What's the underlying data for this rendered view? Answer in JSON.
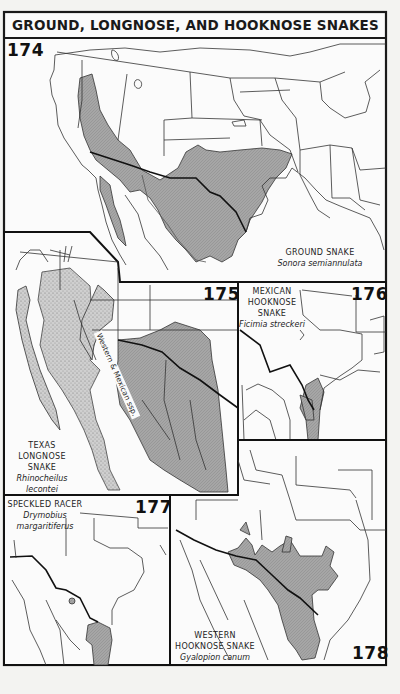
{
  "page": {
    "title": "GROUND, LONGNOSE, AND HOOKNOSE SNAKES",
    "background": "#f3f3f1",
    "range_fill": "#a9a9a9",
    "stipple_fill": "#c4c4c4",
    "line_color": "#222222"
  },
  "maps": [
    {
      "number": "174",
      "common_name": "GROUND SNAKE",
      "scientific_name": "Sonora semiannulata",
      "region": "Western United States & northern Mexico"
    },
    {
      "number": "175",
      "common_name_lines": [
        "TEXAS",
        "LONGNOSE",
        "SNAKE"
      ],
      "scientific_name_lines": [
        "Rhinocheilus",
        "lecontei"
      ],
      "band_label": "Western & Mexican ssp.",
      "region": "Southwestern US & Mexico"
    },
    {
      "number": "176",
      "common_name_lines": [
        "MEXICAN",
        "HOOKNOSE",
        "SNAKE"
      ],
      "scientific_name": "Ficimia streckeri",
      "region": "South Texas & NE Mexico"
    },
    {
      "number": "177",
      "common_name": "SPECKLED RACER",
      "scientific_name_lines": [
        "Drymobius",
        "margaritiferus"
      ],
      "region": "South Texas tip & NE Mexico"
    },
    {
      "number": "178",
      "common_name_lines": [
        "WESTERN",
        "HOOKNOSE SNAKE"
      ],
      "scientific_name": "Gyalopion canum",
      "region": "SW US & northern Mexico"
    }
  ]
}
